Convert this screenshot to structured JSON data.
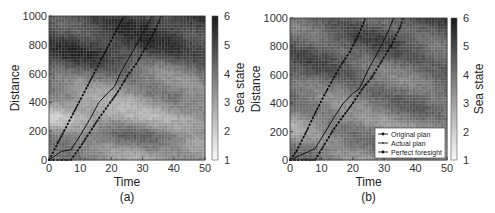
{
  "chart_data": [
    {
      "type": "heatmap",
      "panel_label": "(a)",
      "title": "",
      "xlabel": "Time",
      "ylabel": "Distance",
      "colorbar_label": "Sea state",
      "xlim": [
        0,
        50
      ],
      "ylim": [
        0,
        1000
      ],
      "xticks": [
        0,
        10,
        20,
        30,
        40,
        50
      ],
      "yticks": [
        0,
        200,
        400,
        600,
        800,
        1000
      ],
      "colorbar_ticks": [
        1,
        2,
        3,
        4,
        5,
        6
      ],
      "colorbar_range": [
        1,
        6
      ],
      "colormap": "gray_reversed",
      "heatmap_bands": [
        {
          "y_center": 720,
          "value": 5.2
        },
        {
          "y_center": 640,
          "value": 4.4
        },
        {
          "y_center": 450,
          "value": 3.6
        },
        {
          "y_center": 300,
          "value": 2.6
        },
        {
          "y_center": 180,
          "value": 4.0
        },
        {
          "y_center": 60,
          "value": 3.5
        }
      ],
      "series": [
        {
          "name": "Original plan",
          "style": "dashed-dots",
          "x": [
            0,
            3,
            6,
            9,
            12,
            15,
            18,
            21,
            24
          ],
          "y": [
            0,
            125,
            250,
            375,
            500,
            625,
            750,
            875,
            1000
          ]
        },
        {
          "name": "Actual plan",
          "style": "solid",
          "x": [
            0,
            2,
            4,
            7,
            10,
            13,
            16,
            19,
            21,
            23,
            27,
            30,
            33
          ],
          "y": [
            0,
            30,
            60,
            70,
            170,
            280,
            400,
            470,
            510,
            610,
            760,
            880,
            1000
          ]
        },
        {
          "name": "Perfect foresight",
          "style": "dashed-dots",
          "x": [
            0,
            7,
            10,
            13,
            16,
            19,
            22,
            25,
            28,
            31,
            34,
            36
          ],
          "y": [
            0,
            0,
            90,
            190,
            290,
            380,
            470,
            580,
            670,
            780,
            900,
            1000
          ]
        }
      ]
    },
    {
      "type": "heatmap",
      "panel_label": "(b)",
      "title": "",
      "xlabel": "Time",
      "ylabel": "Distance",
      "colorbar_label": "Sea state",
      "xlim": [
        0,
        50
      ],
      "ylim": [
        0,
        1000
      ],
      "xticks": [
        0,
        10,
        20,
        30,
        40,
        50
      ],
      "yticks": [
        0,
        200,
        400,
        600,
        800,
        1000
      ],
      "colorbar_ticks": [
        1,
        2,
        3,
        4,
        5,
        6
      ],
      "colorbar_range": [
        1,
        6
      ],
      "colormap": "gray_reversed",
      "legend": {
        "position": "lower right",
        "entries": [
          "Original plan",
          "Actual plan",
          "Perfect foresight"
        ]
      },
      "heatmap_bands": [
        {
          "y_center": 720,
          "value": 4.6
        },
        {
          "y_center": 560,
          "value": 4.4
        },
        {
          "y_center": 400,
          "value": 4.2
        },
        {
          "y_center": 250,
          "value": 3.4
        },
        {
          "y_center": 100,
          "value": 3.8
        }
      ],
      "series": [
        {
          "name": "Original plan",
          "style": "dashed-dots",
          "x": [
            0,
            2,
            5,
            8,
            11,
            14,
            16,
            19,
            22,
            24
          ],
          "y": [
            0,
            60,
            190,
            330,
            460,
            580,
            660,
            760,
            890,
            1000
          ]
        },
        {
          "name": "Actual plan",
          "style": "solid",
          "x": [
            0,
            3,
            6,
            8,
            11,
            14,
            17,
            20,
            22,
            25,
            28,
            31,
            33
          ],
          "y": [
            0,
            30,
            60,
            80,
            190,
            300,
            400,
            470,
            500,
            640,
            760,
            890,
            1000
          ]
        },
        {
          "name": "Perfect foresight",
          "style": "dashed-dots",
          "x": [
            0,
            8,
            11,
            14,
            17,
            20,
            23,
            26,
            29,
            32,
            35,
            36
          ],
          "y": [
            0,
            0,
            110,
            220,
            310,
            400,
            500,
            580,
            690,
            800,
            930,
            1000
          ]
        }
      ]
    }
  ]
}
